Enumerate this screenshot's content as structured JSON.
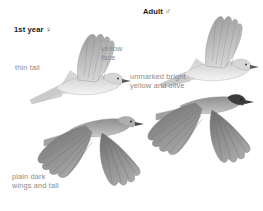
{
  "plate": {
    "title": "Bird identification flight plate",
    "background_color": "#ffffff",
    "style": "field guide illustration, grayscale",
    "heading_color": "#1a1a1a",
    "annotation_color": "#8a8a8a"
  },
  "headings": {
    "first_year": "1st year",
    "first_year_symbol": "♀",
    "adult": "Adult",
    "adult_symbol": "♂"
  },
  "annotations": {
    "yellow_face": "yellow\nface",
    "thin_tail": "thin tail",
    "unmarked": "unmarked bright\nyellow and olive",
    "plain_dark": "plain dark\nwings and tail"
  },
  "figures": [
    {
      "name": "first-year-side-view",
      "position": "upper-left",
      "description": "bird in flight, side profile facing right, wing raised",
      "tone": "pale gray"
    },
    {
      "name": "adult-side-view",
      "position": "upper-right",
      "description": "bird in flight, side profile facing right, wing raised",
      "tone": "pale gray"
    },
    {
      "name": "first-year-dorsal-view",
      "position": "lower-left",
      "description": "bird in flight from above, wings spread",
      "tone": "medium gray"
    },
    {
      "name": "adult-dorsal-view",
      "position": "lower-right",
      "description": "bird in flight from above, wings spread, dark cap",
      "tone": "medium gray with dark crown"
    }
  ]
}
